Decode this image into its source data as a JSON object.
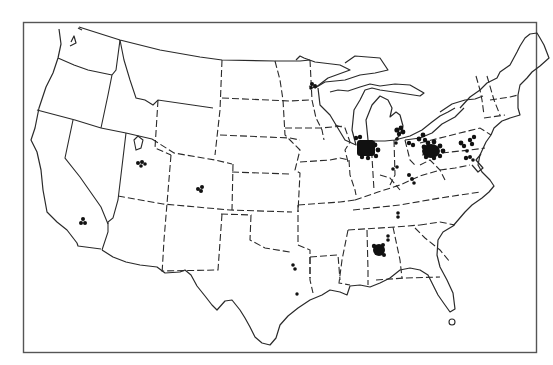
{
  "map": {
    "title": "",
    "region": "Contiguous United States",
    "style": "black-and-white outline map with state borders and site markers",
    "colors": {
      "background": "#ffffff",
      "lines": "#2a2a2a",
      "markers": "#111111",
      "frame": "#555555"
    },
    "frame": {
      "x": 23,
      "y": 22,
      "width": 513,
      "height": 331
    },
    "marker_clusters": [
      {
        "name": "southern-california",
        "cx": 83,
        "cy": 222,
        "count": 3
      },
      {
        "name": "utah",
        "cx": 141,
        "cy": 163,
        "count": 4
      },
      {
        "name": "colorado",
        "cx": 200,
        "cy": 189,
        "count": 3
      },
      {
        "name": "minnesota-duluth",
        "cx": 313,
        "cy": 86,
        "count": 3
      },
      {
        "name": "northern-illinois-indiana",
        "cx": 369,
        "cy": 150,
        "count": 24
      },
      {
        "name": "southeast-michigan",
        "cx": 399,
        "cy": 131,
        "count": 5
      },
      {
        "name": "northwest-ohio",
        "cx": 400,
        "cy": 143,
        "count": 3
      },
      {
        "name": "northern-ohio",
        "cx": 417,
        "cy": 142,
        "count": 4
      },
      {
        "name": "ohio-pennsylvania",
        "cx": 432,
        "cy": 150,
        "count": 28
      },
      {
        "name": "eastern-pennsylvania",
        "cx": 470,
        "cy": 145,
        "count": 8
      },
      {
        "name": "maryland",
        "cx": 467,
        "cy": 159,
        "count": 4
      },
      {
        "name": "kentucky-north",
        "cx": 396,
        "cy": 169,
        "count": 2
      },
      {
        "name": "west-virginia",
        "cx": 411,
        "cy": 178,
        "count": 3
      },
      {
        "name": "tennessee",
        "cx": 398,
        "cy": 215,
        "count": 2
      },
      {
        "name": "alabama-north",
        "cx": 388,
        "cy": 238,
        "count": 2
      },
      {
        "name": "alabama-central",
        "cx": 379,
        "cy": 249,
        "count": 10
      },
      {
        "name": "texas-dallas",
        "cx": 294,
        "cy": 267,
        "count": 2
      },
      {
        "name": "texas-houston",
        "cx": 297,
        "cy": 294,
        "count": 1
      }
    ]
  }
}
